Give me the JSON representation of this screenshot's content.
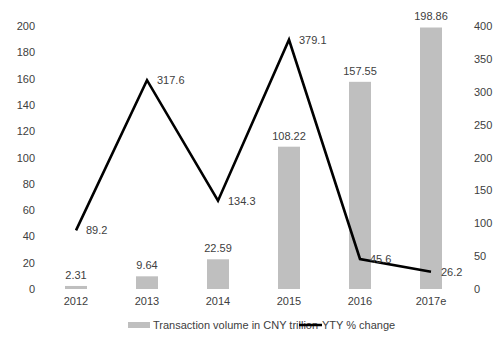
{
  "chart_data": {
    "type": "bar",
    "combo": "bar+line (dual axis)",
    "categories": [
      "2012",
      "2013",
      "2014",
      "2015",
      "2016",
      "2017e"
    ],
    "series": [
      {
        "name": "Transaction volume in CNY trillion",
        "type": "bar",
        "axis": "left",
        "color": "#bfbfbf",
        "values": [
          2.31,
          9.64,
          22.59,
          108.22,
          157.55,
          198.86
        ],
        "labels": [
          "2.31",
          "9.64",
          "22.59",
          "108.22",
          "157.55",
          "198.86"
        ]
      },
      {
        "name": "YTY % change",
        "type": "line",
        "axis": "right",
        "color": "#000000",
        "values": [
          89.2,
          317.6,
          134.3,
          379.1,
          45.6,
          26.2
        ],
        "labels": [
          "89.2",
          "317.6",
          "134.3",
          "379.1",
          "45.6",
          "26.2"
        ]
      }
    ],
    "title": "",
    "xlabel": "",
    "ylabel": "",
    "y_left": {
      "ylim": [
        0,
        200
      ],
      "ticks": [
        "0",
        "20",
        "40",
        "60",
        "80",
        "100",
        "120",
        "140",
        "160",
        "180",
        "200"
      ]
    },
    "y_right": {
      "ylim": [
        0,
        400
      ],
      "ticks": [
        "0",
        "50",
        "100",
        "150",
        "200",
        "250",
        "300",
        "350",
        "400"
      ]
    },
    "grid": false,
    "legend": {
      "position": "bottom",
      "entries": [
        "Transaction volume in CNY trillion",
        "YTY % change"
      ]
    }
  }
}
